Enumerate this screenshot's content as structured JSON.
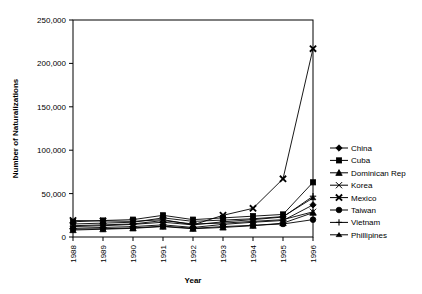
{
  "chart_data": {
    "type": "line",
    "title": "",
    "xlabel": "Year",
    "ylabel": "Number of Naturalizations",
    "categories": [
      "1988",
      "1989",
      "1990",
      "1991",
      "1992",
      "1993",
      "1994",
      "1995",
      "1996"
    ],
    "ylim": [
      0,
      250000
    ],
    "yticks": [
      0,
      50000,
      100000,
      150000,
      200000,
      250000
    ],
    "ytick_labels": [
      "0",
      "50,000",
      "100,000",
      "150,000",
      "200,000",
      "250,000"
    ],
    "grid": false,
    "legend_position": "right",
    "series": [
      {
        "name": "China",
        "marker": "diamond",
        "values": [
          10000,
          11000,
          12000,
          14000,
          11000,
          14500,
          17000,
          19000,
          37000
        ]
      },
      {
        "name": "Cuba",
        "marker": "square",
        "values": [
          17500,
          19000,
          20000,
          25000,
          20000,
          22000,
          24000,
          26000,
          63000
        ]
      },
      {
        "name": "Dominican Rep",
        "marker": "triangle",
        "values": [
          8000,
          9000,
          10000,
          12000,
          9500,
          11000,
          13000,
          16000,
          28000
        ]
      },
      {
        "name": "Korea",
        "marker": "cross-thin",
        "values": [
          13000,
          14000,
          15000,
          19000,
          15000,
          16000,
          18000,
          20000,
          29000
        ]
      },
      {
        "name": "Mexico",
        "marker": "cross-bold",
        "values": [
          19000,
          18500,
          18000,
          20000,
          14000,
          25000,
          33000,
          67000,
          217000
        ]
      },
      {
        "name": "Taiwan",
        "marker": "circle",
        "values": [
          9000,
          9500,
          10500,
          12500,
          10000,
          12000,
          13500,
          15000,
          20000
        ]
      },
      {
        "name": "Vietnam",
        "marker": "plus",
        "values": [
          12000,
          13000,
          14500,
          17000,
          14000,
          17500,
          20000,
          23000,
          47000
        ]
      },
      {
        "name": "Phillipines",
        "marker": "small-triangle",
        "values": [
          15000,
          16000,
          17000,
          22000,
          18000,
          19500,
          21000,
          23500,
          45000
        ]
      }
    ]
  },
  "legend": {
    "items": [
      {
        "label": "China"
      },
      {
        "label": "Cuba"
      },
      {
        "label": "Dominican Rep"
      },
      {
        "label": "Korea"
      },
      {
        "label": "Mexico"
      },
      {
        "label": "Taiwan"
      },
      {
        "label": "Vietnam"
      },
      {
        "label": "Phillipines"
      }
    ]
  },
  "colors": {
    "line": "#000000",
    "frame": "#000000",
    "background": "#ffffff"
  }
}
